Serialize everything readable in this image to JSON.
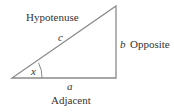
{
  "diagram": {
    "type": "right-triangle",
    "sides": {
      "hypotenuse": {
        "name": "Hypotenuse",
        "symbol": "c"
      },
      "opposite": {
        "name": "Opposite",
        "symbol": "b"
      },
      "adjacent": {
        "name": "Adjacent",
        "symbol": "a"
      }
    },
    "angle": {
      "symbol": "x"
    },
    "colors": {
      "line": "#8a8a8a",
      "text": "#333333"
    }
  }
}
